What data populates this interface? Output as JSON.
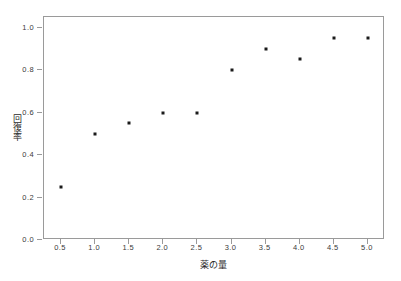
{
  "chart_data": {
    "type": "scatter",
    "title": "",
    "subtitle": "",
    "xlabel": "薬の量",
    "ylabel": "回復率",
    "xlim": [
      0.25,
      5.25
    ],
    "ylim": [
      0.0,
      1.05
    ],
    "xticks": [
      0.5,
      1.0,
      1.5,
      2.0,
      2.5,
      3.0,
      3.5,
      4.0,
      4.5,
      5.0
    ],
    "xtick_labels": [
      "0.5",
      "1.0",
      "1.5",
      "2.0",
      "2.5",
      "3.0",
      "3.5",
      "4.0",
      "4.5",
      "5.0"
    ],
    "yticks": [
      0.0,
      0.2,
      0.4,
      0.6,
      0.8,
      1.0
    ],
    "ytick_labels": [
      "0.0",
      "0.2",
      "0.4",
      "0.6",
      "0.8",
      "1.0"
    ],
    "grid": false,
    "legend": null,
    "marker": "square",
    "marker_color": "#1a1a1a",
    "frame_color": "#9a9a9a",
    "background": "#ffffff",
    "x": [
      0.5,
      1.0,
      1.5,
      2.0,
      2.5,
      3.0,
      3.5,
      4.0,
      4.5,
      5.0
    ],
    "values": [
      0.25,
      0.5,
      0.55,
      0.6,
      0.6,
      0.8,
      0.9,
      0.85,
      0.95,
      0.95
    ],
    "points": [
      {
        "x": 0.5,
        "y": 0.25
      },
      {
        "x": 1.0,
        "y": 0.5
      },
      {
        "x": 1.5,
        "y": 0.55
      },
      {
        "x": 2.0,
        "y": 0.6
      },
      {
        "x": 2.5,
        "y": 0.6
      },
      {
        "x": 3.0,
        "y": 0.8
      },
      {
        "x": 3.5,
        "y": 0.9
      },
      {
        "x": 4.0,
        "y": 0.85
      },
      {
        "x": 4.5,
        "y": 0.95
      },
      {
        "x": 5.0,
        "y": 0.95
      }
    ]
  }
}
